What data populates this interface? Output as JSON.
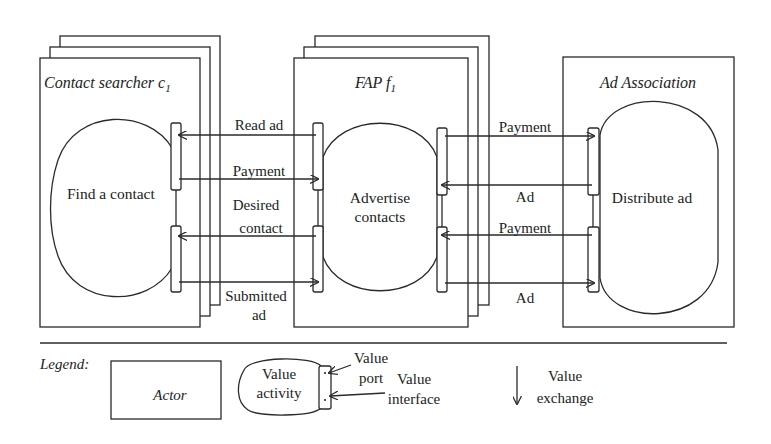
{
  "diagram": {
    "type": "e3-value model",
    "actors": [
      {
        "id": "contact-searcher",
        "label": "Contact searcher c",
        "subscript": "1",
        "stacked": true,
        "activity": "Find a contact"
      },
      {
        "id": "fap",
        "label": "FAP f",
        "subscript": "1",
        "stacked": true,
        "activity_line1": "Advertise",
        "activity_line2": "contacts"
      },
      {
        "id": "ad-association",
        "label": "Ad Association",
        "stacked": false,
        "activity": "Distribute ad"
      }
    ],
    "exchanges_left": [
      {
        "label": "Read ad",
        "direction": "to-contact-searcher"
      },
      {
        "label": "Payment",
        "direction": "to-fap"
      },
      {
        "label_line1": "Desired",
        "label_line2": "contact",
        "direction": "to-contact-searcher"
      },
      {
        "label_line1": "Submitted",
        "label_line2": "ad",
        "direction": "to-fap"
      }
    ],
    "exchanges_right": [
      {
        "label": "Payment",
        "direction": "to-ad-association"
      },
      {
        "label": "Ad",
        "direction": "to-fap"
      },
      {
        "label": "Payment",
        "direction": "to-fap"
      },
      {
        "label": "Ad",
        "direction": "to-ad-association"
      }
    ]
  },
  "legend": {
    "title": "Legend:",
    "actor": "Actor",
    "value_activity_line1": "Value",
    "value_activity_line2": "activity",
    "value_port_line1": "Value",
    "value_port_line2": "port",
    "value_interface_line1": "Value",
    "value_interface_line2": "interface",
    "value_exchange_line1": "Value",
    "value_exchange_line2": "exchange"
  },
  "colors": {
    "stroke": "#2a2a2a",
    "text": "#222222",
    "background": "#ffffff"
  }
}
